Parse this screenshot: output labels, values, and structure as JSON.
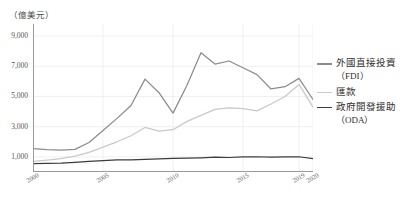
{
  "axis": {
    "unit_label": "（億美元）",
    "y_ticks": [
      "9,000",
      "7,000",
      "5,000",
      "3,000",
      "1,000"
    ],
    "x_ticks": [
      "2000",
      "2005",
      "2010",
      "2015",
      "2019",
      "2020"
    ]
  },
  "legend": {
    "items": [
      {
        "label": "外國直接投資",
        "sub": "（FDI）",
        "color": "#8c8c8c"
      },
      {
        "label": "匯款",
        "sub": "",
        "color": "#c9c9c9"
      },
      {
        "label": "政府開發援助",
        "sub": "（ODA）",
        "color": "#3c3c3c"
      }
    ]
  },
  "colors": {
    "fdi": "#8c8c8c",
    "remittance": "#c9c9c9",
    "oda": "#3c3c3c",
    "axis": "#9a9a9a",
    "grid": "#ececec"
  },
  "chart_data": {
    "type": "line",
    "title": "",
    "xlabel": "",
    "ylabel": "（億美元）",
    "xlim": [
      2000,
      2020
    ],
    "ylim": [
      0,
      9800
    ],
    "grid": true,
    "legend_position": "right",
    "x": [
      2000,
      2001,
      2002,
      2003,
      2004,
      2005,
      2006,
      2007,
      2008,
      2009,
      2010,
      2011,
      2012,
      2013,
      2014,
      2015,
      2016,
      2017,
      2018,
      2019,
      2020
    ],
    "series": [
      {
        "name": "外國直接投資（FDI）",
        "color": "#8c8c8c",
        "values": [
          1550,
          1480,
          1450,
          1500,
          1950,
          2750,
          3550,
          4400,
          6150,
          5250,
          3900,
          5750,
          7900,
          7150,
          7350,
          6900,
          6450,
          5500,
          5650,
          6200,
          4800
        ]
      },
      {
        "name": "匯款",
        "color": "#c9c9c9",
        "values": [
          700,
          780,
          880,
          1050,
          1300,
          1650,
          2000,
          2400,
          2950,
          2700,
          2800,
          3350,
          3750,
          4150,
          4250,
          4200,
          4050,
          4500,
          5000,
          5800,
          4300
        ]
      },
      {
        "name": "政府開發援助（ODA）",
        "color": "#3c3c3c",
        "values": [
          560,
          570,
          590,
          640,
          700,
          760,
          800,
          810,
          840,
          870,
          900,
          920,
          940,
          980,
          960,
          1000,
          1010,
          990,
          1000,
          1010,
          880
        ]
      }
    ]
  }
}
